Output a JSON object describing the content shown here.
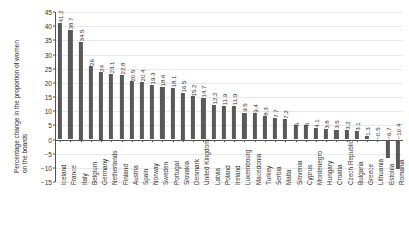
{
  "chart_data": {
    "type": "bar",
    "title": "",
    "subtitle": "",
    "xlabel": "",
    "ylabel": "Percentage change in the proportion of women on the boards",
    "ylabel_line1": "Percentage change in the proportion of women",
    "ylabel_line2": "on the boards",
    "ylim": [
      -15,
      45
    ],
    "ytick_step": 5,
    "yticks": [
      45,
      40,
      35,
      30,
      25,
      20,
      15,
      10,
      5,
      0,
      "−5",
      "−10",
      "−15"
    ],
    "grid": true,
    "legend": "none",
    "bar_color": "#595959",
    "axis_color": "#555555",
    "grid_color": "#e9e9e9",
    "value_labels_rotated": true,
    "categories": [
      "Iceland",
      "France",
      "Italy",
      "Belgium",
      "Germany",
      "Netherlands",
      "Finland",
      "Austria",
      "Spain",
      "Norway",
      "Sweden",
      "Portugal",
      "Slovakia",
      "Denmark",
      "United Kingdom",
      "Latvia",
      "Poland",
      "Ireland",
      "Luxembourg",
      "Macedonia",
      "Turkey",
      "Serbia",
      "Malta",
      "Slovenia",
      "Cyprus",
      "Montenegro",
      "Hungary",
      "Croatia",
      "Czech Republic",
      "Bulgaria",
      "Greece",
      "Lithuania",
      "Estonia",
      "Romania"
    ],
    "values": [
      41.2,
      38.7,
      34.5,
      26,
      24,
      23.1,
      22.8,
      20.5,
      20.4,
      19.3,
      18.6,
      18.1,
      16.5,
      15.2,
      14.7,
      12.2,
      11.9,
      11.9,
      9.5,
      9.4,
      8.3,
      7.7,
      7.2,
      5,
      5,
      4.1,
      3.8,
      3.5,
      3.2,
      3.1,
      1.3,
      -0.5,
      -6.7,
      -10.4
    ],
    "value_labels": [
      "41.2",
      "38.7",
      "34.5",
      "26",
      "24",
      "23.1",
      "22.8",
      "20.5",
      "20.4",
      "19.3",
      "18.6",
      "18.1",
      "16.5",
      "15.2",
      "14.7",
      "12.2",
      "11.9",
      "11.9",
      "9.5",
      "9.4",
      "8.3",
      "7.7",
      "7.2",
      "5",
      "5",
      "4.1",
      "3.8",
      "3.5",
      "3.2",
      "3.1",
      "1.3",
      "−0.5",
      "−6.7",
      "−10.4"
    ]
  }
}
